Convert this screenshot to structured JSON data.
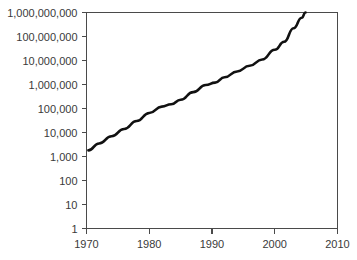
{
  "chart_data": {
    "type": "line",
    "title": "",
    "subtitle": "",
    "xlabel": "",
    "ylabel": "",
    "yscale": "log",
    "xscale": "linear",
    "grid": false,
    "legend": false,
    "legend_position": "none",
    "xlim": [
      1970,
      2010
    ],
    "ylim": [
      1,
      1000000000
    ],
    "xticks": [
      1970,
      1980,
      1990,
      2000,
      2010
    ],
    "xtick_labels": [
      "1970",
      "1980",
      "1990",
      "2000",
      "2010"
    ],
    "yticks": [
      1,
      10,
      100,
      1000,
      10000,
      100000,
      1000000,
      10000000,
      100000000,
      1000000000
    ],
    "ytick_labels": [
      "1",
      "10",
      "100",
      "1,000",
      "10,000",
      "100,000",
      "1,000,000",
      "10,000,000",
      "100,000,000",
      "1,000,000,000"
    ],
    "series": [
      {
        "name": "growth",
        "color": "#111111",
        "x": [
          1970.3,
          1972,
          1974,
          1976,
          1978,
          1980,
          1982,
          1983.5,
          1985,
          1987,
          1989,
          1990.5,
          1992,
          1994,
          1996,
          1998,
          2000,
          2001.5,
          2003,
          2004.3,
          2004.9
        ],
        "y": [
          1800,
          3500,
          7000,
          14000,
          30000,
          65000,
          120000,
          150000,
          230000,
          480000,
          950000,
          1200000,
          2000000,
          3500000,
          6000000,
          11000000,
          28000000,
          60000000,
          220000000,
          600000000,
          1000000000
        ]
      }
    ],
    "annotations": []
  },
  "axes": {
    "y_axis_name": "value-axis",
    "x_axis_name": "year-axis"
  }
}
